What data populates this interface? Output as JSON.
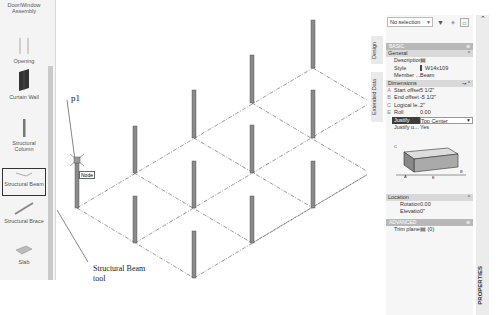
{
  "tool_palette": {
    "items": [
      {
        "label": "Door/Window Assembly",
        "icon": "door-window-assembly-icon"
      },
      {
        "label": "Opening",
        "icon": "opening-icon"
      },
      {
        "label": "Curtain Wall",
        "icon": "curtain-wall-icon"
      },
      {
        "label": "Structural Column",
        "icon": "structural-column-icon"
      },
      {
        "label": "Structural Beam",
        "icon": "structural-beam-icon",
        "selected": true
      },
      {
        "label": "Structural Brace",
        "icon": "structural-brace-icon"
      },
      {
        "label": "Slab",
        "icon": "slab-icon"
      }
    ]
  },
  "viewport": {
    "point_label": "p1",
    "snap_tooltip": "Node",
    "callout": {
      "line1": "Structural Beam",
      "line2": "tool"
    }
  },
  "side_tabs": {
    "design": "Design",
    "extended_data": "Extended Data"
  },
  "properties": {
    "selection": "No selection",
    "toolbar_icons": [
      "quick-select-icon",
      "select-objects-icon",
      "toggle-pickadd-icon"
    ],
    "basic_header": "BASIC",
    "general": {
      "title": "General",
      "rows": [
        {
          "key": "Description",
          "value": "",
          "icon": "edit-icon"
        },
        {
          "key": "Style",
          "value": "W14x109",
          "icon": "beam-style-icon"
        },
        {
          "key": "Member ...",
          "value": "Beam"
        }
      ]
    },
    "dimensions": {
      "title": "Dimensions",
      "rows": [
        {
          "letter": "A",
          "key": "Start offset",
          "value": "5 1/2\""
        },
        {
          "letter": "B",
          "key": "End offset",
          "value": "-5 1/2\""
        },
        {
          "letter": "C",
          "key": "Logical le...",
          "value": "2\""
        },
        {
          "letter": "E",
          "key": "Roll",
          "value": "0.00"
        },
        {
          "letter": "",
          "key": "Justify",
          "value": "Top Center",
          "highlighted": true
        },
        {
          "letter": "",
          "key": "Justify u...",
          "value": "Yes"
        }
      ]
    },
    "location": {
      "title": "Location",
      "rows": [
        {
          "key": "Rotation",
          "value": "0.00"
        },
        {
          "key": "Elevation",
          "value": "0\""
        }
      ]
    },
    "advanced_header": "ADVANCED",
    "advanced_rows": [
      {
        "key": "Trim planes",
        "value": "(0)"
      }
    ],
    "panel_title": "PROPERTIES"
  }
}
